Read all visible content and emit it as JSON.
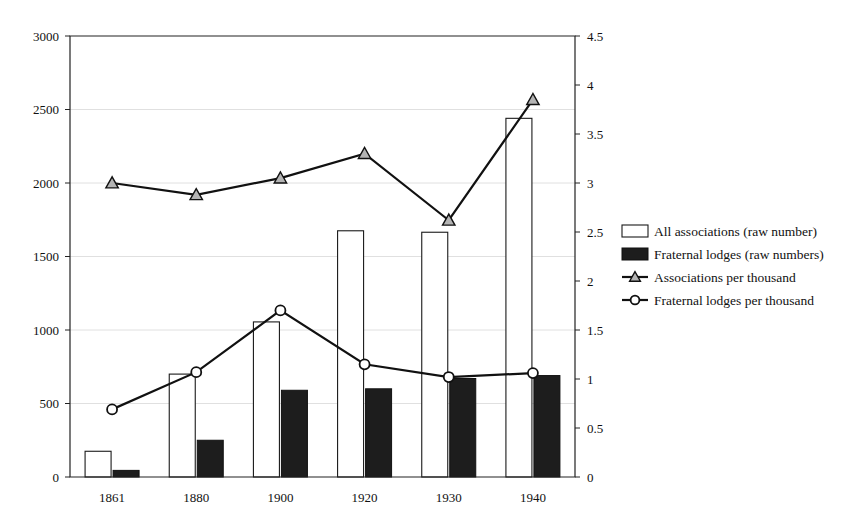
{
  "chart_data": {
    "type": "bar",
    "title": "",
    "subtitle": "",
    "xlabel": "",
    "ylabel": "",
    "y2label": "",
    "categories": [
      "1861",
      "1880",
      "1900",
      "1920",
      "1930",
      "1940"
    ],
    "ylim": [
      0,
      3000
    ],
    "y2lim": [
      0,
      4.5
    ],
    "yticks": [
      "0",
      "500",
      "1000",
      "1500",
      "2000",
      "2500",
      "3000"
    ],
    "ytick_values": [
      0,
      500,
      1000,
      1500,
      2000,
      2500,
      3000
    ],
    "y2ticks": [
      "0",
      "0.5",
      "1",
      "1.5",
      "2",
      "2.5",
      "3",
      "3.5",
      "4",
      "4.5"
    ],
    "y2tick_values": [
      0,
      0.5,
      1,
      1.5,
      2,
      2.5,
      3,
      3.5,
      4,
      4.5
    ],
    "grid": true,
    "legend_position": "right",
    "series": [
      {
        "name": "All associations (raw number)",
        "marker": "open-bar",
        "axis": "left",
        "kind": "bar",
        "values": [
          175,
          700,
          1055,
          1675,
          1665,
          2440
        ]
      },
      {
        "name": "Fraternal lodges (raw numbers)",
        "marker": "filled-bar",
        "axis": "left",
        "kind": "bar",
        "values": [
          45,
          250,
          590,
          600,
          670,
          690
        ]
      },
      {
        "name": "Associations per thousand",
        "marker": "triangle",
        "axis": "right",
        "kind": "line",
        "values": [
          3.0,
          2.88,
          3.05,
          3.3,
          2.62,
          3.85
        ]
      },
      {
        "name": "Fraternal lodges per thousand",
        "marker": "circle",
        "axis": "right",
        "kind": "line",
        "values": [
          0.69,
          1.07,
          1.7,
          1.15,
          1.02,
          1.06
        ]
      }
    ],
    "colors": {
      "open_bar_fill": "#ffffff",
      "open_bar_stroke": "#1a1a1a",
      "filled_bar_fill": "#1d1d1d",
      "line": "#111111",
      "grid": "#d8d8d8",
      "axis": "#222222",
      "background": "#ffffff"
    }
  },
  "legend": {
    "items": [
      {
        "label": "All associations (raw number)",
        "swatch": "open-rect"
      },
      {
        "label": "Fraternal lodges (raw numbers)",
        "swatch": "filled-rect"
      },
      {
        "label": "Associations per thousand",
        "swatch": "line-triangle"
      },
      {
        "label": "Fraternal lodges per thousand",
        "swatch": "line-circle"
      }
    ]
  }
}
